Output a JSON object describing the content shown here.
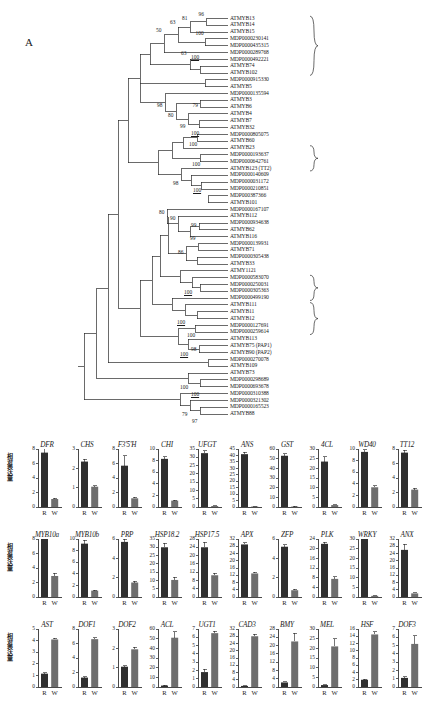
{
  "figure": {
    "panel_a_letter": "A",
    "panel_b_letter": "B",
    "y_axis_label": "相对表达量",
    "category_labels": [
      "R",
      "W"
    ]
  },
  "tree": {
    "clade_labels": [
      {
        "text": "胁迫响应",
        "first": 0,
        "last": 8
      },
      {
        "text": "原花青素合成",
        "first": 19,
        "last": 22
      },
      {
        "text": "黄酮醇合成",
        "first": 38,
        "last": 41
      },
      {
        "text": "花青苷合成",
        "first": 42,
        "last": 46
      }
    ],
    "taxa": [
      "ATMYB13",
      "ATMYB14",
      "ATMYB15",
      "MDP0000230141",
      "MDP0000435315",
      "MDP0000289768",
      "MDP0000492221",
      "ATMYB74",
      "ATMYB102",
      "MDP0000915330",
      "ATMYB5",
      "MDP0000135594",
      "ATMYB3",
      "ATMYB6",
      "ATMYB4",
      "ATMYB7",
      "ATMYB32",
      "MDP0000805075",
      "ATMYB60",
      "ATMYB23",
      "MDP0000193637",
      "MDP0000642761",
      "ATMYB123 (TT2)",
      "MDP0000140609",
      "MDP0000031172",
      "MDP0000210851",
      "MDP000387366",
      "ATMYB101",
      "MDP0000167107",
      "ATMYB112",
      "MDP0000934638",
      "ATMYB62",
      "ATMYB116",
      "MDP0000139931",
      "ATMYB71",
      "MDP0000305438",
      "ATMYB33",
      "ATMY1121",
      "MDP0000583070",
      "MDP0000250031",
      "MDP0000305363",
      "MDP0000499190",
      "ATMYB111",
      "ATMYB11",
      "ATMYB12",
      "MDP0000127691",
      "MDP0000259614",
      "ATMYB113",
      "ATMYB75 (PAP1)",
      "ATMYB90 (PAP2)",
      "MDP0000270078",
      "ATMYB109",
      "ATMYB73",
      "MDP0000298689",
      "MDP0000693678",
      "MDP0000310388",
      "MDP0000321302",
      "MDP0000165523",
      "ATMYB88"
    ],
    "bootstrap_values": [
      "96",
      "81",
      "63",
      "50",
      "100",
      "63",
      "100",
      "98",
      "79",
      "80",
      "99",
      "100",
      "100",
      "100",
      "98",
      "100",
      "80",
      "90",
      "99",
      "99",
      "86",
      "100",
      "100",
      "100",
      "98",
      "100",
      "100",
      "79",
      "97"
    ]
  },
  "chart_data": [
    {
      "type": "bar",
      "title": "DFR",
      "categories": [
        "R",
        "W"
      ],
      "values": [
        7.5,
        1.1
      ],
      "errors": [
        0.6,
        0.1
      ],
      "ylim": [
        0,
        8
      ],
      "ticks": [
        0,
        2,
        4,
        6,
        8
      ],
      "ylabel": "相对表达量"
    },
    {
      "type": "bar",
      "title": "CHS",
      "categories": [
        "R",
        "W"
      ],
      "values": [
        2.35,
        1.05
      ],
      "errors": [
        0.12,
        0.06
      ],
      "ylim": [
        0,
        3
      ],
      "ticks": [
        0,
        1,
        2,
        3
      ],
      "ylabel": "相对表达量"
    },
    {
      "type": "bar",
      "title": "F3'5'H",
      "categories": [
        "R",
        "W"
      ],
      "values": [
        5.7,
        1.2
      ],
      "errors": [
        1.4,
        0.15
      ],
      "ylim": [
        0,
        8
      ],
      "ticks": [
        0,
        2,
        4,
        6,
        8
      ],
      "ylabel": "相对表达量"
    },
    {
      "type": "bar",
      "title": "CHI",
      "categories": [
        "R",
        "W"
      ],
      "values": [
        8.3,
        1.1
      ],
      "errors": [
        0.4,
        0.1
      ],
      "ylim": [
        0,
        10
      ],
      "ticks": [
        0,
        2,
        4,
        6,
        8,
        10
      ],
      "ylabel": "相对表达量"
    },
    {
      "type": "bar",
      "title": "UFGT",
      "categories": [
        "R",
        "W"
      ],
      "values": [
        32.5,
        0.6
      ],
      "errors": [
        1.5,
        0.1
      ],
      "ylim": [
        0,
        35
      ],
      "ticks": [
        0,
        5,
        10,
        15,
        20,
        25,
        30,
        35
      ],
      "ylabel": "相对表达量"
    },
    {
      "type": "bar",
      "title": "ANS",
      "categories": [
        "R",
        "W"
      ],
      "values": [
        41,
        0.4
      ],
      "errors": [
        1.5,
        0.1
      ],
      "ylim": [
        0,
        45
      ],
      "ticks": [
        0,
        5,
        10,
        15,
        20,
        25,
        30,
        35,
        40,
        45
      ],
      "ylabel": "相对表达量"
    },
    {
      "type": "bar",
      "title": "GST",
      "categories": [
        "R",
        "W"
      ],
      "values": [
        53,
        0.5
      ],
      "errors": [
        2.0,
        0.1
      ],
      "ylim": [
        0,
        60
      ],
      "ticks": [
        0,
        10,
        20,
        30,
        40,
        50,
        60
      ],
      "ylabel": "相对表达量"
    },
    {
      "type": "bar",
      "title": "4CL",
      "categories": [
        "R",
        "W"
      ],
      "values": [
        23.5,
        1.0
      ],
      "errors": [
        2.5,
        0.2
      ],
      "ylim": [
        0,
        30
      ],
      "ticks": [
        0,
        5,
        10,
        15,
        20,
        25,
        30
      ],
      "ylabel": "相对表达量"
    },
    {
      "type": "bar",
      "title": "WD40",
      "categories": [
        "R",
        "W"
      ],
      "values": [
        9.5,
        3.4
      ],
      "errors": [
        0.4,
        0.25
      ],
      "ylim": [
        0,
        10
      ],
      "ticks": [
        0,
        2,
        4,
        6,
        8,
        10
      ],
      "ylabel": "相对表达量"
    },
    {
      "type": "bar",
      "title": "TT12",
      "categories": [
        "R",
        "W"
      ],
      "values": [
        7.5,
        2.4
      ],
      "errors": [
        0.3,
        0.2
      ],
      "ylim": [
        0,
        8
      ],
      "ticks": [
        0,
        2,
        4,
        6,
        8
      ],
      "ylabel": "相对表达量"
    },
    {
      "type": "bar",
      "title": "MYB10a",
      "categories": [
        "R",
        "W"
      ],
      "values": [
        8.1,
        2.9
      ],
      "errors": [
        0.15,
        0.35
      ],
      "ylim": [
        0,
        8
      ],
      "ticks": [
        0,
        2,
        4,
        6,
        8
      ],
      "ylabel": "相对表达量"
    },
    {
      "type": "bar",
      "title": "MYB10b",
      "categories": [
        "R",
        "W"
      ],
      "values": [
        9.2,
        1.1
      ],
      "errors": [
        0.6,
        0.1
      ],
      "ylim": [
        0,
        10
      ],
      "ticks": [
        0,
        2,
        4,
        6,
        8,
        10
      ],
      "ylabel": "相对表达量"
    },
    {
      "type": "bar",
      "title": "PRP",
      "categories": [
        "R",
        "W"
      ],
      "values": [
        5.7,
        1.5
      ],
      "errors": [
        0.25,
        0.15
      ],
      "ylim": [
        0,
        6
      ],
      "ticks": [
        0,
        2,
        4,
        6
      ],
      "ylabel": "相对表达量"
    },
    {
      "type": "bar",
      "title": "HSP18.2",
      "categories": [
        "R",
        "W"
      ],
      "values": [
        30,
        10.3
      ],
      "errors": [
        2.5,
        1.5
      ],
      "ylim": [
        0,
        35
      ],
      "ticks": [
        0,
        5,
        10,
        15,
        20,
        25,
        30,
        35
      ],
      "ylabel": "相对表达量"
    },
    {
      "type": "bar",
      "title": "HSP17.5",
      "categories": [
        "R",
        "W"
      ],
      "values": [
        24,
        10.5
      ],
      "errors": [
        2.5,
        1.0
      ],
      "ylim": [
        0,
        28
      ],
      "ticks": [
        0,
        4,
        8,
        12,
        16,
        20,
        24,
        28
      ],
      "ylabel": "相对表达量"
    },
    {
      "type": "bar",
      "title": "APX",
      "categories": [
        "R",
        "W"
      ],
      "values": [
        29,
        13
      ],
      "errors": [
        0.8,
        0.6
      ],
      "ylim": [
        0,
        32
      ],
      "ticks": [
        0,
        4,
        8,
        12,
        16,
        20,
        24,
        28,
        32
      ],
      "ylabel": "相对表达量"
    },
    {
      "type": "bar",
      "title": "ZFP",
      "categories": [
        "R",
        "W"
      ],
      "values": [
        5.2,
        0.7
      ],
      "errors": [
        0.2,
        0.1
      ],
      "ylim": [
        0,
        6
      ],
      "ticks": [
        0,
        2,
        4,
        6
      ],
      "ylabel": "相对表达量"
    },
    {
      "type": "bar",
      "title": "PLK",
      "categories": [
        "R",
        "W"
      ],
      "values": [
        22,
        7.5
      ],
      "errors": [
        0.7,
        0.8
      ],
      "ylim": [
        0,
        24
      ],
      "ticks": [
        0,
        4,
        8,
        12,
        16,
        20,
        24
      ],
      "ylabel": "相对表达量"
    },
    {
      "type": "bar",
      "title": "WRKY",
      "categories": [
        "R",
        "W"
      ],
      "values": [
        30,
        0.6
      ],
      "errors": [
        0.5,
        0.1
      ],
      "ylim": [
        0,
        30
      ],
      "ticks": [
        0,
        5,
        10,
        15,
        20,
        25,
        30
      ],
      "ylabel": "相对表达量"
    },
    {
      "type": "bar",
      "title": "ANX",
      "categories": [
        "R",
        "W"
      ],
      "values": [
        26,
        2.0
      ],
      "errors": [
        3.0,
        0.3
      ],
      "ylim": [
        0,
        32
      ],
      "ticks": [
        0,
        4,
        8,
        12,
        16,
        20,
        24,
        28,
        32
      ],
      "ylabel": "相对表达量"
    },
    {
      "type": "bar",
      "title": "AST",
      "categories": [
        "R",
        "W"
      ],
      "values": [
        1.15,
        4.1
      ],
      "errors": [
        0.08,
        0.12
      ],
      "ylim": [
        0,
        5
      ],
      "ticks": [
        0,
        1,
        2,
        3,
        4,
        5
      ],
      "ylabel": "相对表达量"
    },
    {
      "type": "bar",
      "title": "DOF1",
      "categories": [
        "R",
        "W"
      ],
      "values": [
        1.3,
        6.6
      ],
      "errors": [
        0.12,
        0.2
      ],
      "ylim": [
        0,
        8
      ],
      "ticks": [
        0,
        2,
        4,
        6,
        8
      ],
      "ylabel": "相对表达量"
    },
    {
      "type": "bar",
      "title": "DOF2",
      "categories": [
        "R",
        "W"
      ],
      "values": [
        1.05,
        1.95
      ],
      "errors": [
        0.05,
        0.1
      ],
      "ylim": [
        0,
        3
      ],
      "ticks": [
        0,
        1,
        2,
        3
      ],
      "ylabel": "相对表达量"
    },
    {
      "type": "bar",
      "title": "ACL",
      "categories": [
        "R",
        "W"
      ],
      "values": [
        1.5,
        51
      ],
      "errors": [
        0.4,
        6.0
      ],
      "ylim": [
        0,
        60
      ],
      "ticks": [
        0,
        10,
        20,
        30,
        40,
        50,
        60
      ],
      "ylabel": "相对表达量"
    },
    {
      "type": "bar",
      "title": "UGT1",
      "categories": [
        "R",
        "W"
      ],
      "values": [
        1.8,
        6.5
      ],
      "errors": [
        0.35,
        0.2
      ],
      "ylim": [
        0,
        7
      ],
      "ticks": [
        0,
        1,
        2,
        3,
        4,
        5,
        6,
        7
      ],
      "ylabel": "相对表达量"
    },
    {
      "type": "bar",
      "title": "CAD3",
      "categories": [
        "R",
        "W"
      ],
      "values": [
        0.6,
        28
      ],
      "errors": [
        0.1,
        1.2
      ],
      "ylim": [
        0,
        32
      ],
      "ticks": [
        0,
        4,
        8,
        12,
        16,
        20,
        24,
        28,
        32
      ],
      "ylabel": "相对表达量"
    },
    {
      "type": "bar",
      "title": "BMY",
      "categories": [
        "R",
        "W"
      ],
      "values": [
        2.2,
        22
      ],
      "errors": [
        0.3,
        4.0
      ],
      "ylim": [
        0,
        28
      ],
      "ticks": [
        0,
        4,
        8,
        12,
        16,
        20,
        24,
        28
      ],
      "ylabel": "相对表达量"
    },
    {
      "type": "bar",
      "title": "MEL",
      "categories": [
        "R",
        "W"
      ],
      "values": [
        1.0,
        21
      ],
      "errors": [
        0.2,
        4.0
      ],
      "ylim": [
        0,
        30
      ],
      "ticks": [
        0,
        5,
        10,
        15,
        20,
        25,
        30
      ],
      "ylabel": "相对表达量"
    },
    {
      "type": "bar",
      "title": "HSF",
      "categories": [
        "R",
        "W"
      ],
      "values": [
        2.0,
        14.5
      ],
      "errors": [
        0.2,
        0.8
      ],
      "ylim": [
        0,
        16
      ],
      "ticks": [
        0,
        2,
        4,
        6,
        8,
        10,
        12,
        14,
        16
      ],
      "ylabel": "相对表达量"
    },
    {
      "type": "bar",
      "title": "DOF3",
      "categories": [
        "R",
        "W"
      ],
      "values": [
        1.1,
        5.2
      ],
      "errors": [
        0.15,
        1.0
      ],
      "ylim": [
        0,
        7
      ],
      "ticks": [
        0,
        1,
        2,
        3,
        4,
        5,
        6,
        7
      ],
      "ylabel": "相对表达量"
    }
  ],
  "colors": {
    "bar_r": "#2f2f2f",
    "bar_w": "#6e6e6e",
    "axis": "#1b1b1b",
    "tree_line": "#2b2b2b"
  }
}
